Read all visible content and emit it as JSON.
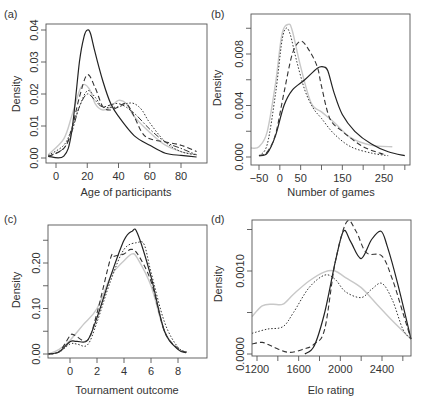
{
  "figure": {
    "panels": [
      "(a)",
      "(b)",
      "(c)",
      "(d)"
    ]
  },
  "chart_data": [
    {
      "panel": "(a)",
      "type": "line",
      "title": "",
      "xlabel": "Age of participants",
      "ylabel": "Density",
      "xticks": [
        "0",
        "20",
        "40",
        "60",
        "80"
      ],
      "yticks": [
        "0.00",
        "0.01",
        "0.02",
        "0.03",
        "0.04"
      ],
      "xlim": [
        -5,
        90
      ],
      "ylim": [
        0,
        0.041
      ],
      "grid": false,
      "legend": "none",
      "series": [
        {
          "name": "solid",
          "style": "solid",
          "x": [
            -5,
            5,
            10,
            15,
            18,
            20,
            22,
            25,
            30,
            35,
            40,
            50,
            60,
            70,
            80,
            90
          ],
          "y": [
            0.0005,
            0.0006,
            0.008,
            0.03,
            0.038,
            0.04,
            0.039,
            0.033,
            0.024,
            0.017,
            0.013,
            0.007,
            0.004,
            0.0015,
            0.0008,
            0.0003
          ]
        },
        {
          "name": "dashed",
          "style": "dashed",
          "x": [
            -5,
            5,
            10,
            15,
            20,
            25,
            30,
            35,
            40,
            45,
            50,
            55,
            60,
            70,
            80,
            90
          ],
          "y": [
            0.0005,
            0.003,
            0.009,
            0.019,
            0.026,
            0.022,
            0.016,
            0.015,
            0.016,
            0.017,
            0.013,
            0.008,
            0.006,
            0.005,
            0.004,
            0.002
          ]
        },
        {
          "name": "dotted",
          "style": "dotted",
          "x": [
            -5,
            5,
            10,
            15,
            20,
            25,
            30,
            40,
            45,
            50,
            55,
            60,
            70,
            80,
            90
          ],
          "y": [
            0.0008,
            0.004,
            0.009,
            0.016,
            0.021,
            0.019,
            0.016,
            0.016,
            0.017,
            0.017,
            0.015,
            0.011,
            0.005,
            0.002,
            0.001
          ]
        },
        {
          "name": "dash-dot",
          "style": "dashdot",
          "x": [
            -5,
            5,
            10,
            15,
            20,
            25,
            30,
            40,
            50,
            60,
            70,
            80,
            90
          ],
          "y": [
            0.0005,
            0.003,
            0.008,
            0.016,
            0.02,
            0.018,
            0.016,
            0.017,
            0.014,
            0.009,
            0.005,
            0.003,
            0.001
          ]
        },
        {
          "name": "grey",
          "style": "grey",
          "x": [
            -5,
            5,
            10,
            15,
            18,
            22,
            25,
            30,
            35,
            40,
            45,
            50,
            60,
            70,
            80,
            90
          ],
          "y": [
            0.001,
            0.006,
            0.013,
            0.021,
            0.023,
            0.021,
            0.017,
            0.015,
            0.016,
            0.018,
            0.017,
            0.013,
            0.008,
            0.004,
            0.002,
            0.001
          ]
        }
      ]
    },
    {
      "panel": "(b)",
      "type": "line",
      "title": "",
      "xlabel": "Number of games",
      "ylabel": "Density",
      "xticks": [
        "-50",
        "0",
        "50",
        "150",
        "250"
      ],
      "yticks": [
        "0.000",
        "0.004",
        "0.008"
      ],
      "xlim": [
        -70,
        310
      ],
      "ylim": [
        0,
        0.0107
      ],
      "grid": false,
      "legend": "none",
      "series": [
        {
          "name": "solid",
          "style": "solid",
          "x": [
            -50,
            -30,
            -10,
            10,
            30,
            60,
            90,
            105,
            115,
            130,
            150,
            180,
            220,
            260,
            300
          ],
          "y": [
            0.0001,
            0.0003,
            0.0017,
            0.004,
            0.0052,
            0.006,
            0.0069,
            0.007,
            0.0067,
            0.005,
            0.0033,
            0.002,
            0.001,
            0.0004,
            0.0001
          ]
        },
        {
          "name": "dashed",
          "style": "dashed",
          "x": [
            -50,
            -30,
            -10,
            10,
            30,
            50,
            70,
            90,
            100,
            120,
            150,
            200,
            250
          ],
          "y": [
            0.0001,
            0.0004,
            0.0018,
            0.005,
            0.008,
            0.009,
            0.0083,
            0.007,
            0.0055,
            0.003,
            0.002,
            0.0008,
            0.0002
          ]
        },
        {
          "name": "dotted",
          "style": "dotted",
          "x": [
            -50,
            -30,
            -10,
            5,
            15,
            25,
            40,
            60,
            80,
            100,
            130,
            170,
            220,
            260
          ],
          "y": [
            0.0001,
            0.001,
            0.005,
            0.009,
            0.01,
            0.0095,
            0.0075,
            0.0052,
            0.0038,
            0.003,
            0.0018,
            0.0008,
            0.0003,
            0.0001
          ]
        },
        {
          "name": "grey",
          "style": "grey",
          "x": [
            -70,
            -50,
            -30,
            -10,
            5,
            20,
            30,
            50,
            75,
            100,
            130,
            170,
            220,
            270
          ],
          "y": [
            0.0007,
            0.0008,
            0.002,
            0.0058,
            0.0095,
            0.0103,
            0.0098,
            0.007,
            0.0042,
            0.0035,
            0.0027,
            0.0015,
            0.0009,
            0.0008
          ]
        }
      ]
    },
    {
      "panel": "(c)",
      "type": "line",
      "title": "",
      "xlabel": "Tournament outcome",
      "ylabel": "Density",
      "xticks": [
        "0",
        "2",
        "4",
        "6",
        "8"
      ],
      "yticks": [
        "0.00",
        "0.10",
        "0.20"
      ],
      "xlim": [
        -1.6,
        9.0
      ],
      "ylim": [
        0,
        0.28
      ],
      "grid": false,
      "legend": "none",
      "series": [
        {
          "name": "solid",
          "style": "solid",
          "x": [
            -1.6,
            -0.8,
            0,
            0.5,
            1.3,
            2,
            3,
            4,
            4.6,
            5,
            6,
            7,
            8,
            8.6
          ],
          "y": [
            0.0,
            0.005,
            0.027,
            0.028,
            0.03,
            0.08,
            0.17,
            0.25,
            0.27,
            0.265,
            0.17,
            0.05,
            0.01,
            0.003
          ]
        },
        {
          "name": "dashed",
          "style": "dashed",
          "x": [
            -1.6,
            -0.8,
            0,
            0.3,
            1.3,
            2,
            3,
            3.3,
            4,
            4.5,
            5,
            6,
            7,
            8,
            8.6
          ],
          "y": [
            0.0,
            0.005,
            0.04,
            0.042,
            0.03,
            0.09,
            0.21,
            0.215,
            0.22,
            0.23,
            0.22,
            0.16,
            0.05,
            0.012,
            0.004
          ]
        },
        {
          "name": "dotted",
          "style": "dotted",
          "x": [
            -1.6,
            -0.8,
            0,
            0.5,
            1.3,
            2,
            3,
            4,
            5,
            5.5,
            6,
            7,
            8,
            8.8
          ],
          "y": [
            0.0,
            0.004,
            0.022,
            0.022,
            0.02,
            0.07,
            0.16,
            0.23,
            0.245,
            0.24,
            0.18,
            0.07,
            0.015,
            0.003
          ]
        },
        {
          "name": "grey",
          "style": "grey",
          "x": [
            -1.6,
            -0.8,
            0,
            1,
            2,
            3,
            3.5,
            4,
            4.6,
            5,
            6,
            7,
            8,
            8.6
          ],
          "y": [
            0.0,
            0.01,
            0.03,
            0.065,
            0.1,
            0.17,
            0.19,
            0.205,
            0.22,
            0.21,
            0.15,
            0.05,
            0.01,
            0.003
          ]
        }
      ]
    },
    {
      "panel": "(d)",
      "type": "line",
      "title": "",
      "xlabel": "Elo rating",
      "ylabel": "Density",
      "xticks": [
        "1200",
        "1600",
        "2000",
        "2400"
      ],
      "yticks": [
        "0.0000",
        "0.0010"
      ],
      "xlim": [
        1150,
        2680
      ],
      "ylim": [
        0,
        0.00162
      ],
      "grid": false,
      "legend": "none",
      "series": [
        {
          "name": "solid",
          "style": "solid",
          "x": [
            1660,
            1750,
            1850,
            1950,
            2030,
            2100,
            2200,
            2300,
            2390,
            2450,
            2550,
            2680
          ],
          "y": [
            0.0,
            0.0001,
            0.0005,
            0.0011,
            0.00148,
            0.00135,
            0.00115,
            0.00138,
            0.00148,
            0.0013,
            0.00085,
            0.00018
          ]
        },
        {
          "name": "dashed",
          "style": "dashed",
          "x": [
            1150,
            1250,
            1350,
            1500,
            1650,
            1750,
            1850,
            1950,
            2060,
            2150,
            2250,
            2400,
            2500,
            2600,
            2680
          ],
          "y": [
            0.00012,
            0.00014,
            9e-05,
            2e-05,
            6e-05,
            0.00012,
            0.0003,
            0.0011,
            0.00159,
            0.00148,
            0.00122,
            0.00118,
            0.0009,
            0.0005,
            0.00018
          ]
        },
        {
          "name": "dotted",
          "style": "dotted",
          "x": [
            1150,
            1300,
            1450,
            1550,
            1700,
            1850,
            1950,
            2050,
            2200,
            2300,
            2400,
            2500,
            2600,
            2680
          ],
          "y": [
            0.00025,
            0.0003,
            0.00033,
            0.0005,
            0.0008,
            0.00095,
            0.0009,
            0.00075,
            0.00068,
            0.00078,
            0.00085,
            0.00065,
            0.0003,
            0.00018
          ]
        },
        {
          "name": "grey",
          "style": "grey",
          "x": [
            1150,
            1250,
            1350,
            1450,
            1550,
            1700,
            1850,
            1950,
            2050,
            2200,
            2350,
            2500,
            2680
          ],
          "y": [
            0.00045,
            0.00058,
            0.0006,
            0.0006,
            0.00072,
            0.00088,
            0.00099,
            0.001,
            0.00092,
            0.0008,
            0.0006,
            0.0004,
            0.00018
          ]
        }
      ]
    }
  ]
}
